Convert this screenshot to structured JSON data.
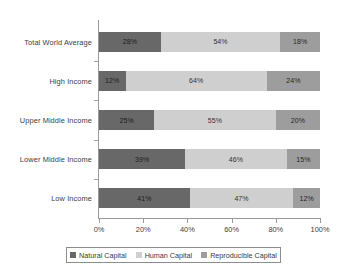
{
  "chart_data": {
    "type": "bar",
    "orientation": "horizontal",
    "stacked": true,
    "normalized_percent": true,
    "title": "",
    "subtitle": "",
    "xlabel": "",
    "ylabel": "",
    "xlim": [
      0,
      100
    ],
    "xticks": [
      "0%",
      "20%",
      "40%",
      "60%",
      "80%",
      "100%"
    ],
    "xtick_values": [
      0,
      20,
      40,
      60,
      80,
      100
    ],
    "grid": false,
    "legend_position": "bottom",
    "categories": [
      "Total World Average",
      "High Income",
      "Upper Middle Income",
      "Lower Middle Income",
      "Low Income"
    ],
    "series": [
      {
        "name": "Natural Capital",
        "color": "#686868",
        "values": [
          28,
          12,
          25,
          39,
          41
        ],
        "labels": [
          "28%",
          "12%",
          "25%",
          "39%",
          "41%"
        ]
      },
      {
        "name": "Human Capital",
        "color": "#cfcfcf",
        "values": [
          54,
          64,
          55,
          46,
          47
        ],
        "labels": [
          "54%",
          "64%",
          "55%",
          "46%",
          "47%"
        ]
      },
      {
        "name": "Reproducible Capital",
        "color": "#9d9d9d",
        "values": [
          18,
          24,
          20,
          15,
          12
        ],
        "labels": [
          "18%",
          "24%",
          "20%",
          "15%",
          "12%"
        ]
      }
    ]
  },
  "legend": {
    "items": [
      {
        "label": "Natural Capital",
        "color": "#686868"
      },
      {
        "label": "Human Capital",
        "color": "#cfcfcf"
      },
      {
        "label": "Reproducible Capital",
        "color": "#9d9d9d"
      }
    ]
  }
}
